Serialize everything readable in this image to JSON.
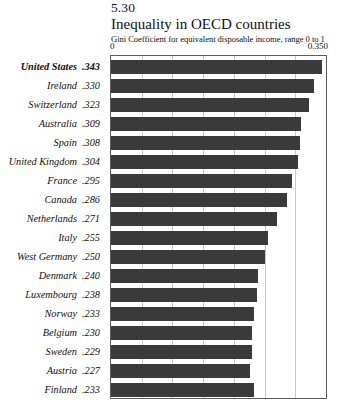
{
  "figure": {
    "number": "5.30",
    "title": "Inequality in OECD countries",
    "subtitle": "Gini Coefficient for equivalent disposable income, range 0 to 1"
  },
  "axis": {
    "min_label": "0",
    "max_label": "0.350"
  },
  "style": {
    "bar_color": "#3a3a3a",
    "gridline_color": "#c9c9c9",
    "border_color": "#5c5c5c",
    "background": "#ffffff"
  },
  "chart_data": {
    "type": "bar",
    "orientation": "horizontal",
    "title": "Inequality in OECD countries",
    "subtitle": "Gini Coefficient for equivalent disposable income, range 0 to 1",
    "figure_number": "5.30",
    "xlabel": "",
    "ylabel": "",
    "xlim": [
      0,
      0.35
    ],
    "grid": true,
    "gridline_values": [
      0.05,
      0.1,
      0.15,
      0.2,
      0.25,
      0.3
    ],
    "legend": false,
    "highlighted_category": "United States",
    "categories": [
      "United States",
      "Ireland",
      "Switzerland",
      "Australia",
      "Spain",
      "United Kingdom",
      "France",
      "Canada",
      "Netherlands",
      "Italy",
      "West Germany",
      "Denmark",
      "Luxembourg",
      "Norway",
      "Belgium",
      "Sweden",
      "Austria",
      "Finland"
    ],
    "values": [
      0.343,
      0.33,
      0.323,
      0.309,
      0.308,
      0.304,
      0.295,
      0.286,
      0.271,
      0.255,
      0.25,
      0.24,
      0.238,
      0.233,
      0.23,
      0.229,
      0.227,
      0.233
    ],
    "value_labels": [
      ".343",
      ".330",
      ".323",
      ".309",
      ".308",
      ".304",
      ".295",
      ".286",
      ".271",
      ".255",
      ".250",
      ".240",
      ".238",
      ".233",
      ".230",
      ".229",
      ".227",
      ".233"
    ]
  }
}
